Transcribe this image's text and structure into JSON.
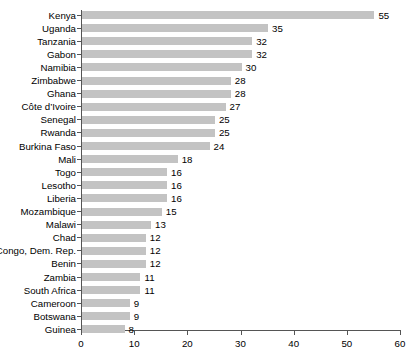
{
  "chart_data": {
    "type": "bar",
    "orientation": "horizontal",
    "title": "",
    "xlabel": "",
    "ylabel": "",
    "xlim": [
      0,
      60
    ],
    "xticks": [
      0,
      10,
      20,
      30,
      40,
      50,
      60
    ],
    "grid": false,
    "legend": null,
    "bar_color": "#c3c3c3",
    "axis_color": "#555555",
    "background_color": "#ffffff",
    "categories": [
      "Kenya",
      "Uganda",
      "Tanzania",
      "Gabon",
      "Namibia",
      "Zimbabwe",
      "Ghana",
      "Côte d’Ivoire",
      "Senegal",
      "Rwanda",
      "Burkina Faso",
      "Mali",
      "Togo",
      "Lesotho",
      "Liberia",
      "Mozambique",
      "Malawi",
      "Chad",
      "Congo, Dem. Rep.",
      "Benin",
      "Zambia",
      "South Africa",
      "Cameroon",
      "Botswana",
      "Guinea"
    ],
    "values": [
      55,
      35,
      32,
      32,
      30,
      28,
      28,
      27,
      25,
      25,
      24,
      18,
      16,
      16,
      16,
      15,
      13,
      12,
      12,
      12,
      11,
      11,
      9,
      9,
      8
    ],
    "value_labels": [
      "55",
      "35",
      "32",
      "32",
      "30",
      "28",
      "28",
      "27",
      "25",
      "25",
      "24",
      "18",
      "16",
      "16",
      "16",
      "15",
      "13",
      "12",
      "12",
      "12",
      "11",
      "11",
      "9",
      "9",
      "8"
    ],
    "xtick_labels": [
      "0",
      "10",
      "20",
      "30",
      "40",
      "50",
      "60"
    ]
  }
}
